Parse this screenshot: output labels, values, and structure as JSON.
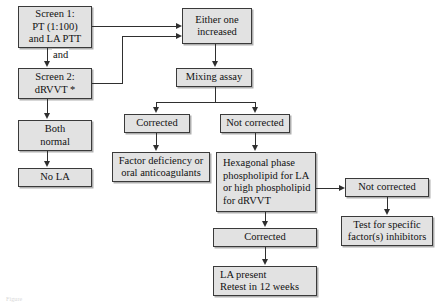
{
  "diagram": {
    "colors": {
      "node_fill": "#e2e2e2",
      "node_border": "#3a3a3a",
      "edge": "#2f2f2f",
      "background": "#ffffff"
    },
    "nodes": {
      "screen1": {
        "label": "Screen 1:\nPT (1:100)\nand LA PTT"
      },
      "screen2": {
        "label": "Screen 2:\ndRVVT *"
      },
      "both_normal": {
        "label": "Both\nnormal"
      },
      "no_la": {
        "label": "No LA"
      },
      "either_one_increased": {
        "label": "Either one\nincreased"
      },
      "mixing_assay": {
        "label": "Mixing assay"
      },
      "corrected_1": {
        "label": "Corrected"
      },
      "not_corrected_1": {
        "label": "Not corrected"
      },
      "factor_deficiency": {
        "label": "Factor deficiency or\noral anticoagulants"
      },
      "hexagonal_phase": {
        "label": "Hexagonal phase\nphospholipid for LA\nor high phospholipid\nfor dRVVT"
      },
      "not_corrected_2": {
        "label": "Not corrected"
      },
      "test_inhibitors": {
        "label": "Test for specific\nfactor(s) inhibitors"
      },
      "corrected_2": {
        "label": "Corrected"
      },
      "la_present": {
        "label": "LA present\nRetest in 12 weeks"
      }
    },
    "edge_labels": {
      "and": "and"
    },
    "caption": {
      "text": "Figure"
    }
  }
}
